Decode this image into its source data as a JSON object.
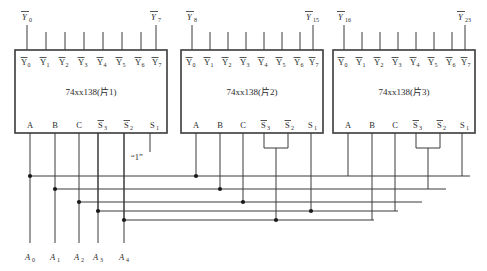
{
  "diagram": {
    "colors": {
      "wire": "#3a3a3a",
      "box": "#3a3a3a",
      "text": "#2b2b2b",
      "dot": "#1a1a1a",
      "background": "#ffffff"
    }
  },
  "chips": [
    {
      "id": "chip1",
      "label": "74xx138(片1)",
      "outputs": [
        "Y0",
        "Y1",
        "Y2",
        "Y3",
        "Y4",
        "Y5",
        "Y6",
        "Y7"
      ],
      "output_overbar": true,
      "inputs": [
        "A",
        "B",
        "C",
        "S3",
        "S2",
        "S1"
      ],
      "input_overbar": [
        false,
        false,
        false,
        true,
        true,
        false
      ],
      "top_left_label": "Y0",
      "top_right_label": "Y7",
      "enable_note": "“1”"
    },
    {
      "id": "chip2",
      "label": "74xx138(片2)",
      "outputs": [
        "Y0",
        "Y1",
        "Y2",
        "Y3",
        "Y4",
        "Y5",
        "Y6",
        "Y7"
      ],
      "output_overbar": true,
      "inputs": [
        "A",
        "B",
        "C",
        "S3",
        "S2",
        "S1"
      ],
      "input_overbar": [
        false,
        false,
        false,
        true,
        true,
        false
      ],
      "top_left_label": "Y8",
      "top_right_label": "Y15"
    },
    {
      "id": "chip3",
      "label": "74xx138(片3)",
      "outputs": [
        "Y0",
        "Y1",
        "Y2",
        "Y3",
        "Y4",
        "Y5",
        "Y6",
        "Y7"
      ],
      "output_overbar": true,
      "inputs": [
        "A",
        "B",
        "C",
        "S3",
        "S2",
        "S1"
      ],
      "input_overbar": [
        false,
        false,
        false,
        true,
        true,
        false
      ],
      "top_left_label": "Y16",
      "top_right_label": "Y23"
    }
  ],
  "bus_inputs": [
    {
      "name": "A0",
      "base": "A",
      "sub": "0"
    },
    {
      "name": "A1",
      "base": "A",
      "sub": "1"
    },
    {
      "name": "A2",
      "base": "A",
      "sub": "2"
    },
    {
      "name": "A3",
      "base": "A",
      "sub": "3"
    },
    {
      "name": "A4",
      "base": "A",
      "sub": "4"
    }
  ],
  "labels": {
    "enable_high": "“1”",
    "y_base": "Y"
  }
}
